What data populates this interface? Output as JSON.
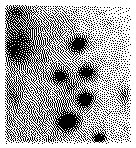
{
  "image": {
    "kind": "stippled-grayscale-field",
    "render_mode": "floyd-steinberg-dither",
    "width": 136,
    "height": 148,
    "background_color": "#ffffff",
    "ink_color": "#000000",
    "description": "Dithered black-and-white stipple rendering of a grayscale field containing several dark compact clusters over a mottled background with a brightness gradient rising toward the upper right",
    "margins": {
      "left": 3,
      "right": 3,
      "top": 3,
      "bottom": 3
    },
    "base_tone": 0.1,
    "noise_amount": 0.1,
    "noise_scale": 4,
    "seed": 20240517
  },
  "chart_data": {
    "type": "heatmap",
    "title": "",
    "xlabel": "",
    "ylabel": "",
    "xlim": [
      0,
      136
    ],
    "ylim": [
      0,
      148
    ],
    "grid": false,
    "legend": "none",
    "value_range": [
      0,
      1
    ],
    "value_meaning": "ink density (0 = white, 1 = solid black)",
    "gradient": {
      "description": "large-scale brightness ramp, darkest toward lower-left/left edge, lightest toward upper-right corner",
      "dark_anchor": [
        0,
        60
      ],
      "light_anchor": [
        136,
        0
      ],
      "strength": 0.3
    },
    "blobs": [
      {
        "name": "left-diffuse-mass",
        "cx": 22,
        "cy": 38,
        "rx": 24,
        "ry": 34,
        "amp": 0.46,
        "falloff": 1.5,
        "angle": -28
      },
      {
        "name": "left-upper-patch",
        "cx": 16,
        "cy": 12,
        "rx": 14,
        "ry": 10,
        "amp": 0.42,
        "falloff": 1.7,
        "angle": 0
      },
      {
        "name": "left-streak",
        "cx": 14,
        "cy": 52,
        "rx": 11,
        "ry": 17,
        "amp": 0.48,
        "falloff": 1.8,
        "angle": -35
      },
      {
        "name": "left-lower-tail",
        "cx": 13,
        "cy": 96,
        "rx": 9,
        "ry": 16,
        "amp": 0.3,
        "falloff": 1.7,
        "angle": -15
      },
      {
        "name": "cluster-upper-mid",
        "cx": 78,
        "cy": 44,
        "rx": 13,
        "ry": 10,
        "amp": 0.93,
        "falloff": 2.3,
        "angle": -25
      },
      {
        "name": "cluster-mid-left",
        "cx": 60,
        "cy": 76,
        "rx": 11,
        "ry": 9,
        "amp": 0.86,
        "falloff": 2.2,
        "angle": -10
      },
      {
        "name": "cluster-mid-right",
        "cx": 87,
        "cy": 72,
        "rx": 12,
        "ry": 9,
        "amp": 0.88,
        "falloff": 2.2,
        "angle": 10
      },
      {
        "name": "cluster-center-low",
        "cx": 85,
        "cy": 99,
        "rx": 11,
        "ry": 10,
        "amp": 0.95,
        "falloff": 2.4,
        "angle": -30
      },
      {
        "name": "cluster-lower-left",
        "cx": 68,
        "cy": 122,
        "rx": 14,
        "ry": 11,
        "amp": 0.95,
        "falloff": 2.3,
        "angle": -12
      },
      {
        "name": "cluster-bottom",
        "cx": 99,
        "cy": 138,
        "rx": 8,
        "ry": 7,
        "amp": 0.92,
        "falloff": 2.5,
        "angle": 0
      },
      {
        "name": "faint-right-edge",
        "cx": 124,
        "cy": 96,
        "rx": 7,
        "ry": 13,
        "amp": 0.4,
        "falloff": 2.0,
        "angle": 0
      },
      {
        "name": "bridge-mid",
        "cx": 72,
        "cy": 86,
        "rx": 16,
        "ry": 9,
        "amp": 0.34,
        "falloff": 1.6,
        "angle": -35
      },
      {
        "name": "haze-lower-mid",
        "cx": 60,
        "cy": 108,
        "rx": 20,
        "ry": 16,
        "amp": 0.22,
        "falloff": 1.5,
        "angle": 0
      },
      {
        "name": "haze-upper-center",
        "cx": 60,
        "cy": 26,
        "rx": 22,
        "ry": 16,
        "amp": 0.2,
        "falloff": 1.5,
        "angle": 0
      }
    ],
    "faint_speckles": [
      {
        "cx": 110,
        "cy": 22,
        "rx": 5,
        "ry": 4,
        "amp": 0.16
      },
      {
        "cx": 122,
        "cy": 40,
        "rx": 4,
        "ry": 4,
        "amp": 0.14
      },
      {
        "cx": 100,
        "cy": 14,
        "rx": 4,
        "ry": 3,
        "amp": 0.12
      },
      {
        "cx": 118,
        "cy": 66,
        "rx": 5,
        "ry": 4,
        "amp": 0.18
      },
      {
        "cx": 36,
        "cy": 118,
        "rx": 6,
        "ry": 5,
        "amp": 0.16
      },
      {
        "cx": 26,
        "cy": 140,
        "rx": 7,
        "ry": 4,
        "amp": 0.2
      },
      {
        "cx": 50,
        "cy": 140,
        "rx": 7,
        "ry": 4,
        "amp": 0.18
      },
      {
        "cx": 126,
        "cy": 128,
        "rx": 5,
        "ry": 5,
        "amp": 0.16
      },
      {
        "cx": 44,
        "cy": 58,
        "rx": 6,
        "ry": 5,
        "amp": 0.18
      },
      {
        "cx": 96,
        "cy": 58,
        "rx": 6,
        "ry": 4,
        "amp": 0.16
      }
    ]
  }
}
